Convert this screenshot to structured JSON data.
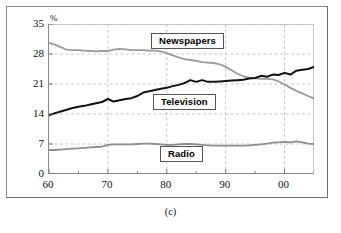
{
  "figure": {
    "caption": "(c)",
    "y_unit": "%"
  },
  "chart_data": {
    "type": "line",
    "title": "",
    "xlabel": "",
    "ylabel": "%",
    "xlim": [
      1960,
      2005
    ],
    "ylim": [
      0,
      35
    ],
    "yticks": [
      0,
      7,
      14,
      21,
      28,
      35
    ],
    "xticks": [
      1960,
      1970,
      1980,
      1990,
      2000
    ],
    "xtick_labels": [
      "60",
      "70",
      "80",
      "90",
      "00"
    ],
    "minor_xticks": [
      1965,
      1975,
      1985,
      1995,
      2005
    ],
    "grid": true,
    "grid_style": "dashed",
    "legend_position": "inline-labels",
    "x": [
      1960,
      1961,
      1962,
      1963,
      1964,
      1965,
      1966,
      1967,
      1968,
      1969,
      1970,
      1971,
      1972,
      1973,
      1974,
      1975,
      1976,
      1977,
      1978,
      1979,
      1980,
      1981,
      1982,
      1983,
      1984,
      1985,
      1986,
      1987,
      1988,
      1989,
      1990,
      1991,
      1992,
      1993,
      1994,
      1995,
      1996,
      1997,
      1998,
      1999,
      2000,
      2001,
      2002,
      2003,
      2004,
      2005
    ],
    "series": [
      {
        "name": "Newspapers",
        "color": "#9a9a9a",
        "values": [
          30.6,
          30.2,
          29.6,
          29.0,
          28.9,
          28.9,
          28.8,
          28.7,
          28.6,
          28.7,
          28.7,
          29.0,
          29.2,
          29.1,
          28.9,
          28.9,
          28.9,
          28.8,
          28.8,
          28.6,
          28.2,
          27.7,
          27.2,
          26.8,
          26.6,
          26.4,
          26.1,
          26.0,
          25.9,
          25.6,
          25.0,
          24.2,
          23.4,
          22.8,
          22.5,
          22.3,
          22.2,
          22.2,
          22.1,
          21.6,
          20.9,
          20.1,
          19.4,
          18.8,
          18.2,
          17.6
        ]
      },
      {
        "name": "Television",
        "color": "#111111",
        "values": [
          13.7,
          14.2,
          14.6,
          15.0,
          15.4,
          15.7,
          15.9,
          16.2,
          16.5,
          16.8,
          17.5,
          16.9,
          17.2,
          17.5,
          17.7,
          18.2,
          19.0,
          19.3,
          19.6,
          19.9,
          20.1,
          20.5,
          20.8,
          21.2,
          21.9,
          21.5,
          21.9,
          21.5,
          21.5,
          21.6,
          21.7,
          21.8,
          21.9,
          22.0,
          22.3,
          22.4,
          22.9,
          22.7,
          23.2,
          23.1,
          23.6,
          23.2,
          24.1,
          24.3,
          24.5,
          25.0
        ]
      },
      {
        "name": "Radio",
        "color": "#8e8e8e",
        "values": [
          5.6,
          5.6,
          5.7,
          5.8,
          5.9,
          6.0,
          6.1,
          6.2,
          6.3,
          6.4,
          6.8,
          6.9,
          6.9,
          6.9,
          6.9,
          7.0,
          7.1,
          7.1,
          7.0,
          6.9,
          6.8,
          6.8,
          6.9,
          7.0,
          7.0,
          6.9,
          6.8,
          6.7,
          6.6,
          6.6,
          6.6,
          6.6,
          6.6,
          6.6,
          6.7,
          6.8,
          6.9,
          7.1,
          7.3,
          7.4,
          7.5,
          7.4,
          7.6,
          7.4,
          7.1,
          7.0
        ]
      }
    ],
    "annotations": [
      {
        "text": "Newspapers",
        "x_px": 151,
        "y_px": 33
      },
      {
        "text": "Television",
        "x_px": 153,
        "y_px": 94
      },
      {
        "text": "Radio",
        "x_px": 160,
        "y_px": 146
      }
    ]
  }
}
